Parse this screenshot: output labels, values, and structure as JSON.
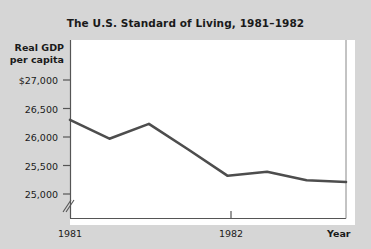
{
  "chart_data": {
    "type": "line",
    "title": "The U.S. Standard of Living, 1981–1982",
    "xlabel": "Year",
    "ylabel": "Real GDP per capita",
    "ylabel_line1": "Real GDP",
    "ylabel_line2": "per capita",
    "ylim": [
      24800,
      27000
    ],
    "y_axis_break": true,
    "grid": false,
    "legend": null,
    "y_ticks": [
      25000,
      25500,
      26000,
      26500,
      27000
    ],
    "y_tick_labels": [
      "25,000",
      "25,500",
      "26,000",
      "26,500",
      "$27,000"
    ],
    "x_ticks": [
      1981,
      1982
    ],
    "x_tick_labels": [
      "1981",
      "1982"
    ],
    "series": [
      {
        "name": "Real GDP per capita",
        "color": "#4d4d4d",
        "x": [
          1981.0,
          1981.25,
          1981.5,
          1981.75,
          1982.0,
          1982.25,
          1982.5,
          1982.75
        ],
        "values": [
          26300,
          25970,
          26230,
          25780,
          25320,
          25390,
          25240,
          25210
        ]
      }
    ]
  },
  "figure": {
    "background_color": "#d6d6d6",
    "plot_background_color": "#ffffff",
    "line_color": "#4d4d4d",
    "axis_color": "#555555",
    "text_color": "#1a1a1a"
  }
}
